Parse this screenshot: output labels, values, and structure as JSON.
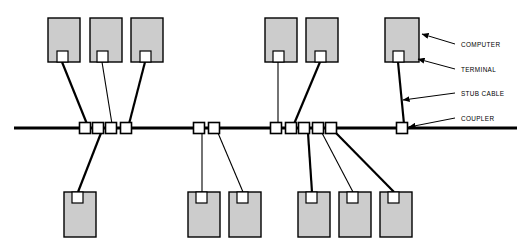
{
  "diagram": {
    "background_color": "#ffffff",
    "line_color": "#000000",
    "node_fill_color": "#cccccc",
    "terminal_fill_color": "#ffffff",
    "coupler_fill_color": "#ffffff",
    "bus": {
      "label": "main bus cable",
      "x1": 14,
      "x2": 517,
      "y": 128
    },
    "callouts": [
      {
        "id": "computer",
        "label": "COMPUTER",
        "text_x": 461,
        "text_y": 47,
        "arrow_from_x": 455,
        "arrow_from_y": 44,
        "arrow_to_x": 422,
        "arrow_to_y": 34
      },
      {
        "id": "terminal",
        "label": "TERMINAL",
        "text_x": 461,
        "text_y": 72,
        "arrow_from_x": 455,
        "arrow_from_y": 69,
        "arrow_to_x": 418,
        "arrow_to_y": 59
      },
      {
        "id": "stub-cable",
        "label": "STUB CABLE",
        "text_x": 461,
        "text_y": 96,
        "arrow_from_x": 455,
        "arrow_from_y": 93,
        "arrow_to_x": 403,
        "arrow_to_y": 100
      },
      {
        "id": "coupler",
        "label": "COUPLER",
        "text_x": 461,
        "text_y": 121,
        "arrow_from_x": 455,
        "arrow_from_y": 118,
        "arrow_to_x": 409,
        "arrow_to_y": 127
      }
    ],
    "couplers": [
      {
        "id": "c1",
        "x": 85,
        "y": 128,
        "w": 11,
        "h": 11
      },
      {
        "id": "c2",
        "x": 98,
        "y": 128,
        "w": 11,
        "h": 11
      },
      {
        "id": "c3",
        "x": 111,
        "y": 128,
        "w": 11,
        "h": 11
      },
      {
        "id": "c4",
        "x": 126,
        "y": 128,
        "w": 11,
        "h": 11
      },
      {
        "id": "c5",
        "x": 199,
        "y": 128,
        "w": 11,
        "h": 11
      },
      {
        "id": "c6",
        "x": 214,
        "y": 128,
        "w": 11,
        "h": 11
      },
      {
        "id": "c7",
        "x": 276,
        "y": 128,
        "w": 11,
        "h": 11
      },
      {
        "id": "c8",
        "x": 291,
        "y": 128,
        "w": 11,
        "h": 11
      },
      {
        "id": "c9",
        "x": 304,
        "y": 128,
        "w": 11,
        "h": 11
      },
      {
        "id": "c10",
        "x": 318,
        "y": 128,
        "w": 11,
        "h": 11
      },
      {
        "id": "c11",
        "x": 331,
        "y": 128,
        "w": 11,
        "h": 11
      },
      {
        "id": "c12",
        "x": 402,
        "y": 128,
        "w": 11,
        "h": 11
      }
    ],
    "nodes": [
      {
        "id": "n-top-1",
        "position": "top",
        "x": 48,
        "y": 18,
        "w": 32,
        "h": 44,
        "terminal_x": 57,
        "terminal_y": 51,
        "terminal_w": 11,
        "terminal_h": 11
      },
      {
        "id": "n-top-2",
        "position": "top",
        "x": 90,
        "y": 18,
        "w": 32,
        "h": 44,
        "terminal_x": 97,
        "terminal_y": 51,
        "terminal_w": 11,
        "terminal_h": 11
      },
      {
        "id": "n-top-3",
        "position": "top",
        "x": 131,
        "y": 18,
        "w": 32,
        "h": 44,
        "terminal_x": 140,
        "terminal_y": 51,
        "terminal_w": 11,
        "terminal_h": 11
      },
      {
        "id": "n-top-4",
        "position": "top",
        "x": 265,
        "y": 18,
        "w": 32,
        "h": 44,
        "terminal_x": 273,
        "terminal_y": 51,
        "terminal_w": 11,
        "terminal_h": 11
      },
      {
        "id": "n-top-5",
        "position": "top",
        "x": 306,
        "y": 18,
        "w": 32,
        "h": 44,
        "terminal_x": 315,
        "terminal_y": 51,
        "terminal_w": 11,
        "terminal_h": 11
      },
      {
        "id": "n-top-6",
        "position": "top",
        "x": 385,
        "y": 18,
        "w": 34,
        "h": 44,
        "terminal_x": 393,
        "terminal_y": 51,
        "terminal_w": 11,
        "terminal_h": 11
      },
      {
        "id": "n-bot-1",
        "position": "bottom",
        "x": 64,
        "y": 192,
        "w": 32,
        "h": 45,
        "terminal_x": 72,
        "terminal_y": 192,
        "terminal_w": 11,
        "terminal_h": 11
      },
      {
        "id": "n-bot-2",
        "position": "bottom",
        "x": 188,
        "y": 192,
        "w": 32,
        "h": 45,
        "terminal_x": 196,
        "terminal_y": 192,
        "terminal_w": 11,
        "terminal_h": 11
      },
      {
        "id": "n-bot-3",
        "position": "bottom",
        "x": 229,
        "y": 192,
        "w": 32,
        "h": 45,
        "terminal_x": 237,
        "terminal_y": 192,
        "terminal_w": 11,
        "terminal_h": 11
      },
      {
        "id": "n-bot-4",
        "position": "bottom",
        "x": 298,
        "y": 192,
        "w": 32,
        "h": 45,
        "terminal_x": 306,
        "terminal_y": 192,
        "terminal_w": 11,
        "terminal_h": 11
      },
      {
        "id": "n-bot-5",
        "position": "bottom",
        "x": 339,
        "y": 192,
        "w": 32,
        "h": 45,
        "terminal_x": 347,
        "terminal_y": 192,
        "terminal_w": 11,
        "terminal_h": 11
      },
      {
        "id": "n-bot-6",
        "position": "bottom",
        "x": 380,
        "y": 192,
        "w": 32,
        "h": 45,
        "terminal_x": 388,
        "terminal_y": 192,
        "terminal_w": 11,
        "terminal_h": 11
      }
    ],
    "stub_cables": [
      {
        "id": "s1",
        "from_node": "n-top-1",
        "to_coupler": "c1",
        "x1": 62,
        "y1": 62,
        "x2": 87,
        "y2": 124,
        "weight": "thick"
      },
      {
        "id": "s2",
        "from_node": "n-top-2",
        "to_coupler": "c3",
        "x1": 102,
        "y1": 62,
        "x2": 112,
        "y2": 124,
        "weight": "thin"
      },
      {
        "id": "s3",
        "from_node": "n-top-3",
        "to_coupler": "c4",
        "x1": 145,
        "y1": 62,
        "x2": 129,
        "y2": 124,
        "weight": "thick"
      },
      {
        "id": "s4",
        "from_node": "n-top-4",
        "to_coupler": "c7",
        "x1": 278,
        "y1": 62,
        "x2": 278,
        "y2": 124,
        "weight": "thin"
      },
      {
        "id": "s5",
        "from_node": "n-top-5",
        "to_coupler": "c8",
        "x1": 320,
        "y1": 62,
        "x2": 294,
        "y2": 124,
        "weight": "thick"
      },
      {
        "id": "s6",
        "from_node": "n-top-6",
        "to_coupler": "c12",
        "x1": 398,
        "y1": 62,
        "x2": 404,
        "y2": 124,
        "weight": "thick"
      },
      {
        "id": "s7",
        "from_node": "n-bot-1",
        "to_coupler": "c2",
        "x1": 78,
        "y1": 192,
        "x2": 101,
        "y2": 133,
        "weight": "thick"
      },
      {
        "id": "s8",
        "from_node": "n-bot-2",
        "to_coupler": "c5",
        "x1": 202,
        "y1": 192,
        "x2": 202,
        "y2": 133,
        "weight": "thin"
      },
      {
        "id": "s9",
        "from_node": "n-bot-3",
        "to_coupler": "c6",
        "x1": 243,
        "y1": 192,
        "x2": 218,
        "y2": 133,
        "weight": "thin"
      },
      {
        "id": "s10",
        "from_node": "n-bot-4",
        "to_coupler": "c9",
        "x1": 312,
        "y1": 192,
        "x2": 308,
        "y2": 133,
        "weight": "thick"
      },
      {
        "id": "s11",
        "from_node": "n-bot-5",
        "to_coupler": "c10",
        "x1": 353,
        "y1": 192,
        "x2": 322,
        "y2": 133,
        "weight": "thin"
      },
      {
        "id": "s12",
        "from_node": "n-bot-6",
        "to_coupler": "c11",
        "x1": 394,
        "y1": 192,
        "x2": 336,
        "y2": 133,
        "weight": "thick"
      }
    ]
  }
}
